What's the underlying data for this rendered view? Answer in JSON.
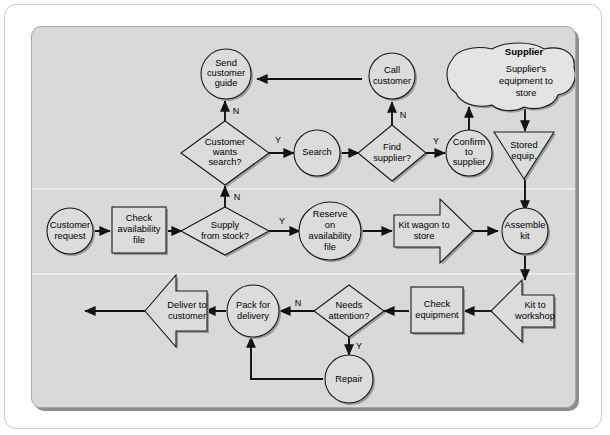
{
  "diagram": {
    "type": "flowchart",
    "lane_label": "Supplier",
    "colors": {
      "panel_background": "#d9d9d9",
      "shape_fill": "#dcdcdc",
      "shape_stroke": "#1a1a1a",
      "connector": "#111111",
      "page_background": "#ffffff"
    },
    "nodes": [
      {
        "id": "send-customer-guide",
        "shape": "circle",
        "label": "Send customer guide",
        "lines": [
          "Send",
          "customer",
          "guide"
        ]
      },
      {
        "id": "call-customer",
        "shape": "circle",
        "label": "Call customer",
        "lines": [
          "Call",
          "customer"
        ]
      },
      {
        "id": "supplier-equipment",
        "shape": "cloud",
        "label": "Supplier's equipment to store",
        "lines": [
          "Supplier's",
          "equipment to",
          "store"
        ]
      },
      {
        "id": "customer-wants-search",
        "shape": "decision",
        "label": "Customer wants search?",
        "lines": [
          "Customer",
          "wants",
          "search?"
        ]
      },
      {
        "id": "search",
        "shape": "circle",
        "label": "Search",
        "lines": [
          "Search"
        ]
      },
      {
        "id": "find-supplier",
        "shape": "decision",
        "label": "Find supplier?",
        "lines": [
          "Find",
          "supplier?"
        ]
      },
      {
        "id": "confirm-to-supplier",
        "shape": "circle",
        "label": "Confirm to supplier",
        "lines": [
          "Confirm",
          "to",
          "supplier"
        ]
      },
      {
        "id": "stored-equip",
        "shape": "triangle-down",
        "label": "Stored equip.",
        "lines": [
          "Stored",
          "equip."
        ]
      },
      {
        "id": "customer-request",
        "shape": "circle",
        "label": "Customer request",
        "lines": [
          "Customer",
          "request"
        ]
      },
      {
        "id": "check-availability",
        "shape": "process",
        "label": "Check availability file",
        "lines": [
          "Check",
          "availability",
          "file"
        ]
      },
      {
        "id": "supply-from-stock",
        "shape": "decision",
        "label": "Supply from stock?",
        "lines": [
          "Supply",
          "from stock?"
        ]
      },
      {
        "id": "reserve-on-file",
        "shape": "circle",
        "label": "Reserve on availability file",
        "lines": [
          "Reserve",
          "on",
          "availability",
          "file"
        ]
      },
      {
        "id": "kit-wagon-to-store",
        "shape": "arrow-right",
        "label": "Kit wagon to store",
        "lines": [
          "Kit wagon to",
          "store"
        ]
      },
      {
        "id": "assemble-kit",
        "shape": "circle",
        "label": "Assemble kit",
        "lines": [
          "Assemble",
          "kit"
        ]
      },
      {
        "id": "kit-to-workshop",
        "shape": "arrow-left",
        "label": "Kit to workshop",
        "lines": [
          "Kit to",
          "workshop"
        ]
      },
      {
        "id": "check-equipment",
        "shape": "process",
        "label": "Check equipment",
        "lines": [
          "Check",
          "equipment"
        ]
      },
      {
        "id": "needs-attention",
        "shape": "decision",
        "label": "Needs attention?",
        "lines": [
          "Needs",
          "attention?"
        ]
      },
      {
        "id": "repair",
        "shape": "circle",
        "label": "Repair",
        "lines": [
          "Repair"
        ]
      },
      {
        "id": "pack-for-delivery",
        "shape": "circle",
        "label": "Pack for delivery",
        "lines": [
          "Pack for",
          "delivery"
        ]
      },
      {
        "id": "deliver-to-customer",
        "shape": "arrow-left",
        "label": "Deliver to customer",
        "lines": [
          "Deliver to",
          "customer"
        ]
      }
    ],
    "edges": [
      {
        "from": "call-customer",
        "to": "send-customer-guide",
        "label": ""
      },
      {
        "from": "customer-wants-search",
        "to": "send-customer-guide",
        "label": "N"
      },
      {
        "from": "customer-wants-search",
        "to": "search",
        "label": "Y"
      },
      {
        "from": "search",
        "to": "find-supplier",
        "label": ""
      },
      {
        "from": "find-supplier",
        "to": "call-customer",
        "label": "N"
      },
      {
        "from": "find-supplier",
        "to": "confirm-to-supplier",
        "label": "Y"
      },
      {
        "from": "confirm-to-supplier",
        "to": "supplier-equipment",
        "label": ""
      },
      {
        "from": "supplier-equipment",
        "to": "stored-equip",
        "label": ""
      },
      {
        "from": "stored-equip",
        "to": "assemble-kit",
        "label": ""
      },
      {
        "from": "customer-request",
        "to": "check-availability",
        "label": ""
      },
      {
        "from": "check-availability",
        "to": "supply-from-stock",
        "label": ""
      },
      {
        "from": "supply-from-stock",
        "to": "customer-wants-search",
        "label": "N"
      },
      {
        "from": "supply-from-stock",
        "to": "reserve-on-file",
        "label": "Y"
      },
      {
        "from": "reserve-on-file",
        "to": "kit-wagon-to-store",
        "label": ""
      },
      {
        "from": "kit-wagon-to-store",
        "to": "assemble-kit",
        "label": ""
      },
      {
        "from": "assemble-kit",
        "to": "kit-to-workshop",
        "label": ""
      },
      {
        "from": "kit-to-workshop",
        "to": "check-equipment",
        "label": ""
      },
      {
        "from": "check-equipment",
        "to": "needs-attention",
        "label": ""
      },
      {
        "from": "needs-attention",
        "to": "pack-for-delivery",
        "label": "N"
      },
      {
        "from": "needs-attention",
        "to": "repair",
        "label": "Y"
      },
      {
        "from": "repair",
        "to": "pack-for-delivery",
        "label": ""
      },
      {
        "from": "pack-for-delivery",
        "to": "deliver-to-customer",
        "label": ""
      }
    ],
    "branch_labels": {
      "wants_search_no": "N",
      "wants_search_yes": "Y",
      "find_supplier_no": "N",
      "find_supplier_yes": "Y",
      "supply_stock_no": "N",
      "supply_stock_yes": "Y",
      "needs_attention_no": "N",
      "needs_attention_yes": "Y"
    },
    "text": {
      "send_customer_guide_1": "Send",
      "send_customer_guide_2": "customer",
      "send_customer_guide_3": "guide",
      "call_customer_1": "Call",
      "call_customer_2": "customer",
      "supplier_lane": "Supplier",
      "supplier_equipment_1": "Supplier's",
      "supplier_equipment_2": "equipment to",
      "supplier_equipment_3": "store",
      "customer_wants_search_1": "Customer",
      "customer_wants_search_2": "wants",
      "customer_wants_search_3": "search?",
      "search_1": "Search",
      "find_supplier_1": "Find",
      "find_supplier_2": "supplier?",
      "confirm_to_supplier_1": "Confirm",
      "confirm_to_supplier_2": "to",
      "confirm_to_supplier_3": "supplier",
      "stored_equip_1": "Stored",
      "stored_equip_2": "equip.",
      "customer_request_1": "Customer",
      "customer_request_2": "request",
      "check_availability_1": "Check",
      "check_availability_2": "availability",
      "check_availability_3": "file",
      "supply_from_stock_1": "Supply",
      "supply_from_stock_2": "from stock?",
      "reserve_1": "Reserve",
      "reserve_2": "on",
      "reserve_3": "availability",
      "reserve_4": "file",
      "kit_wagon_1": "Kit wagon to",
      "kit_wagon_2": "store",
      "assemble_kit_1": "Assemble",
      "assemble_kit_2": "kit",
      "kit_to_workshop_1": "Kit to",
      "kit_to_workshop_2": "workshop",
      "check_equipment_1": "Check",
      "check_equipment_2": "equipment",
      "needs_attention_1": "Needs",
      "needs_attention_2": "attention?",
      "repair_1": "Repair",
      "pack_for_delivery_1": "Pack for",
      "pack_for_delivery_2": "delivery",
      "deliver_to_customer_1": "Deliver to",
      "deliver_to_customer_2": "customer"
    }
  }
}
